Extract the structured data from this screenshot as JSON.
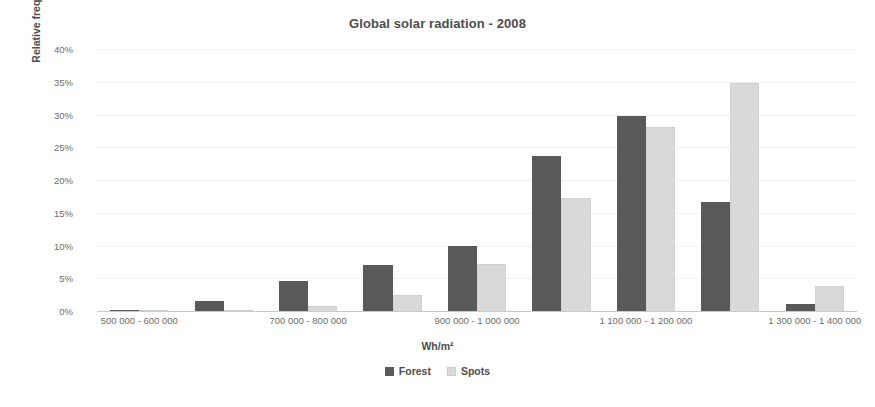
{
  "chart_data": {
    "type": "bar",
    "title": "Global solar radiation - 2008",
    "xlabel": "Wh/m²",
    "ylabel": "Relative frequency",
    "ylim": [
      0,
      40
    ],
    "ytick_labels": [
      "40%",
      "35%",
      "30%",
      "25%",
      "20%",
      "15%",
      "10%",
      "5%",
      "0%"
    ],
    "ytick_values": [
      40,
      35,
      30,
      25,
      20,
      15,
      10,
      5,
      0
    ],
    "grid": true,
    "legend_position": "bottom",
    "categories": [
      "500 000 - 600 000",
      "600 000 - 700 000",
      "700 000 - 800 000",
      "800 000 - 900 000",
      "900 000 - 1 000 000",
      "1 000 000 - 1 100 000",
      "1 100 000 - 1 200 000",
      "1 200 000 - 1 300 000",
      "1 300 000 - 1 400 000"
    ],
    "visible_tick_labels": [
      {
        "index": 0,
        "label": "500 000 - 600 000"
      },
      {
        "index": 2,
        "label": "700 000 - 800 000"
      },
      {
        "index": 4,
        "label": "900 000 - 1 000 000"
      },
      {
        "index": 6,
        "label": "1 100 000 - 1 200 000"
      },
      {
        "index": 8,
        "label": "1 300 000 - 1 400 000"
      }
    ],
    "series": [
      {
        "name": "Forest",
        "color": "#595959",
        "values": [
          0.2,
          1.5,
          4.6,
          7.1,
          9.9,
          23.7,
          29.8,
          16.6,
          1.1
        ]
      },
      {
        "name": "Spots",
        "color": "#d9d9d9",
        "values": [
          0.1,
          0.2,
          0.7,
          2.5,
          7.2,
          17.3,
          28.1,
          34.8,
          3.8
        ]
      }
    ]
  },
  "legend": {
    "items": [
      {
        "label": "Forest",
        "swatch": "forest"
      },
      {
        "label": "Spots",
        "swatch": "spots"
      }
    ]
  }
}
